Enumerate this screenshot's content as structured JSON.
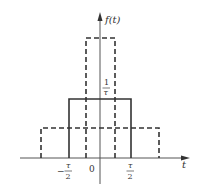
{
  "diagram": {
    "type": "rectangular pulse family",
    "y_axis_label": "f(t)",
    "x_axis_label": "t",
    "origin_label": "0",
    "height_label": {
      "numerator": "1",
      "denominator": "τ"
    },
    "tick_left": {
      "sign": "−",
      "numerator": "τ",
      "denominator": "2"
    },
    "tick_right": {
      "numerator": "τ",
      "denominator": "2"
    },
    "pulses": [
      {
        "name": "narrow-tall",
        "style": "dashed",
        "x_from": "-τ/4",
        "x_to": "τ/4",
        "height": "2/τ"
      },
      {
        "name": "reference",
        "style": "solid",
        "x_from": "-τ/2",
        "x_to": "τ/2",
        "height": "1/τ"
      },
      {
        "name": "wide-short",
        "style": "dashed",
        "x_from": "-τ",
        "x_to": "τ",
        "height": "1/(2τ)"
      }
    ],
    "colors": {
      "line": "#333333",
      "axis": "#555555",
      "background": "#ffffff"
    }
  }
}
